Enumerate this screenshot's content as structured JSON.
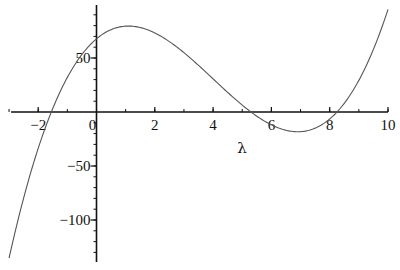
{
  "chart_data": {
    "type": "line",
    "title": "",
    "xlabel": "λ",
    "ylabel": "",
    "xlim": [
      -3,
      10
    ],
    "ylim": [
      -139,
      99
    ],
    "grid": false,
    "legend": null,
    "x_ticks": [
      -2,
      0,
      2,
      4,
      6,
      8,
      10
    ],
    "x_tick_labels": [
      "-2",
      "0",
      "2",
      "4",
      "6",
      "8",
      "10"
    ],
    "y_ticks": [
      50,
      -50,
      -100
    ],
    "y_tick_labels": [
      "50",
      "-50",
      "-100"
    ],
    "series": [
      {
        "name": "f(λ)",
        "description": "cubic approx (λ+1.55)(λ-5.3)(λ-8.25)",
        "roots": [
          -1.55,
          5.3,
          8.25
        ],
        "local_max": {
          "x": 1.15,
          "y": 79.6
        },
        "local_min": {
          "x": 7.0,
          "y": -18
        },
        "x": [
          -3,
          -2.5,
          -2,
          -1.5,
          -1,
          -0.5,
          0,
          0.5,
          1,
          1.5,
          2,
          2.5,
          3,
          3.5,
          4,
          4.5,
          5,
          5.5,
          6,
          6.5,
          7,
          7.5,
          8,
          8.5,
          9,
          9.5,
          10
        ],
        "values": [
          -135.4,
          -97.1,
          -63.7,
          -34.9,
          -10.6,
          9.5,
          67.8,
          75.2,
          79.1,
          79.8,
          77.9,
          73.5,
          66.9,
          58.6,
          48.9,
          38.2,
          26.8,
          15.2,
          3.6,
          -7.4,
          -18.2,
          -15.2,
          -7.3,
          7.9,
          32.8,
          59.9,
          95.1
        ]
      }
    ]
  },
  "axes": {
    "x_label": "λ"
  }
}
